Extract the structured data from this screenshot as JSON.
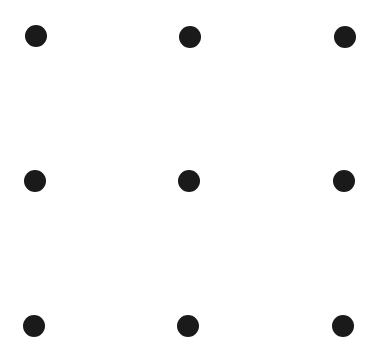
{
  "diagram": {
    "type": "dot-grid",
    "rows": 3,
    "cols": 3,
    "dot_color": "#1a1a1a",
    "dot_diameter": 22,
    "background": "#ffffff",
    "dots": [
      {
        "row": 0,
        "col": 0,
        "x": 36,
        "y": 36
      },
      {
        "row": 0,
        "col": 1,
        "x": 190,
        "y": 37
      },
      {
        "row": 0,
        "col": 2,
        "x": 345,
        "y": 37
      },
      {
        "row": 1,
        "col": 0,
        "x": 35,
        "y": 181
      },
      {
        "row": 1,
        "col": 1,
        "x": 189,
        "y": 181
      },
      {
        "row": 1,
        "col": 2,
        "x": 344,
        "y": 181
      },
      {
        "row": 2,
        "col": 0,
        "x": 34,
        "y": 326
      },
      {
        "row": 2,
        "col": 1,
        "x": 188,
        "y": 326
      },
      {
        "row": 2,
        "col": 2,
        "x": 343,
        "y": 326
      }
    ]
  }
}
